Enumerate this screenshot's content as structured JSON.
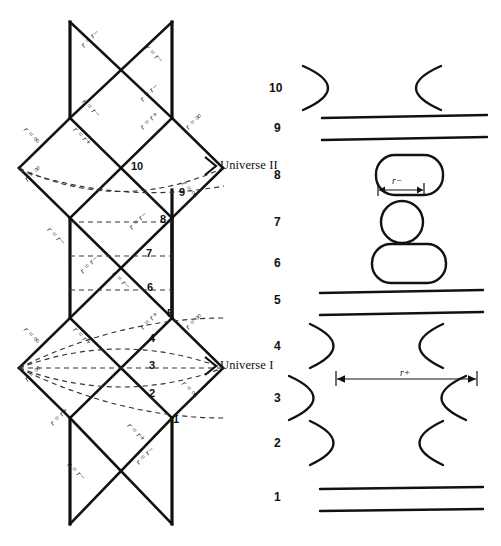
{
  "figure": {
    "type": "penrose-diagram-with-embedding-diagrams",
    "universes": [
      {
        "name": "universe-II",
        "label": "Universe II",
        "x": 216,
        "y": 165
      },
      {
        "name": "universe-I",
        "label": "Universe I",
        "x": 216,
        "y": 365
      }
    ],
    "slice_numbers_left": [
      {
        "label": "10",
        "x": 137,
        "y": 166
      },
      {
        "label": "9",
        "x": 182,
        "y": 192
      },
      {
        "label": "8",
        "x": 163,
        "y": 219
      },
      {
        "label": "7",
        "x": 149,
        "y": 253
      },
      {
        "label": "6",
        "x": 150,
        "y": 285
      },
      {
        "label": "5",
        "x": 170,
        "y": 313
      },
      {
        "label": "4",
        "x": 152,
        "y": 338
      },
      {
        "label": "3",
        "x": 152,
        "y": 365
      },
      {
        "label": "2",
        "x": 152,
        "y": 393
      },
      {
        "label": "1",
        "x": 176,
        "y": 419
      }
    ],
    "edge_labels": [
      {
        "text": "r = r−",
        "x": 93,
        "y": 46,
        "rot": -45
      },
      {
        "text": "r = r−",
        "x": 158,
        "y": 46,
        "rot": 45
      },
      {
        "text": "r = r−",
        "x": 95,
        "y": 100,
        "rot": 45
      },
      {
        "text": "r = r−",
        "x": 152,
        "y": 100,
        "rot": -45
      },
      {
        "text": "r = ∞",
        "x": 35,
        "y": 128,
        "rot": 45
      },
      {
        "text": "r = r+",
        "x": 86,
        "y": 128,
        "rot": 45
      },
      {
        "text": "r = r+",
        "x": 152,
        "y": 128,
        "rot": -45
      },
      {
        "text": "r = ∞",
        "x": 196,
        "y": 128,
        "rot": -45
      },
      {
        "text": "r = ∞",
        "x": 35,
        "y": 180,
        "rot": -45
      },
      {
        "text": "r = ∞",
        "x": 193,
        "y": 182,
        "rot": 45
      },
      {
        "text": "r = r−",
        "x": 60,
        "y": 228,
        "rot": 45
      },
      {
        "text": "r = r−",
        "x": 141,
        "y": 228,
        "rot": -45
      },
      {
        "text": "r = r−",
        "x": 92,
        "y": 272,
        "rot": -45
      },
      {
        "text": "r = r−",
        "x": 125,
        "y": 272,
        "rot": 45
      },
      {
        "text": "r = ∞",
        "x": 35,
        "y": 328,
        "rot": 45
      },
      {
        "text": "r = r+",
        "x": 86,
        "y": 328,
        "rot": 45
      },
      {
        "text": "r = r+",
        "x": 152,
        "y": 328,
        "rot": -45
      },
      {
        "text": "r = ∞",
        "x": 196,
        "y": 328,
        "rot": -45
      },
      {
        "text": "r = ∞",
        "x": 35,
        "y": 380,
        "rot": -45
      },
      {
        "text": "r = ∞",
        "x": 193,
        "y": 382,
        "rot": 45
      },
      {
        "text": "r = r+",
        "x": 62,
        "y": 424,
        "rot": -45
      },
      {
        "text": "r = r+",
        "x": 140,
        "y": 424,
        "rot": 45
      },
      {
        "text": "r = r−",
        "x": 80,
        "y": 463,
        "rot": 45
      },
      {
        "text": "r = r−",
        "x": 148,
        "y": 463,
        "rot": -45
      }
    ],
    "embedding_rows": [
      {
        "num": "10",
        "kind": "throat-open",
        "y": 88,
        "half_gap": 60
      },
      {
        "num": "9",
        "kind": "two-lines",
        "y": 128,
        "half_gap": 0
      },
      {
        "num": "8",
        "kind": "rounded-rect",
        "y": 175,
        "half_gap": 0
      },
      {
        "num": "7",
        "kind": "circle",
        "y": 222,
        "half_gap": 0
      },
      {
        "num": "6",
        "kind": "rounded-rect",
        "y": 263,
        "half_gap": 0
      },
      {
        "num": "5",
        "kind": "two-lines",
        "y": 300,
        "half_gap": 0
      },
      {
        "num": "4",
        "kind": "throat-open",
        "y": 346,
        "half_gap": 45
      },
      {
        "num": "3",
        "kind": "throat-open",
        "y": 398,
        "half_gap": 88
      },
      {
        "num": "2",
        "kind": "throat-open",
        "y": 443,
        "half_gap": 45
      },
      {
        "num": "1",
        "kind": "two-lines",
        "y": 497,
        "half_gap": 0
      }
    ],
    "measurements": [
      {
        "name": "r-minus-measure",
        "label": "r−",
        "x": 371,
        "y": 187,
        "width": 36
      },
      {
        "name": "r-plus-measure",
        "label": "r+",
        "x": 382,
        "y": 381,
        "width": 148
      }
    ],
    "colors": {
      "ink": "#111111",
      "background": "#ffffff",
      "dashed": "#333333"
    }
  }
}
